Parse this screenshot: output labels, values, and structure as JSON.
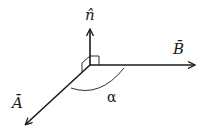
{
  "diagram": {
    "type": "vector-diagram",
    "labels": {
      "normal": "n̂",
      "vector_b": "B̄",
      "vector_a": "Ā",
      "angle": "α"
    },
    "elements": [
      {
        "name": "normal-vector",
        "label": "n̂",
        "direction": "up"
      },
      {
        "name": "vector-b",
        "label": "B̄",
        "direction": "right"
      },
      {
        "name": "vector-a",
        "label": "Ā",
        "direction": "down-left"
      },
      {
        "name": "angle-arc",
        "label": "α",
        "between": [
          "vector-a",
          "vector-b"
        ]
      },
      {
        "name": "right-angle-markers",
        "between": [
          "normal-vector",
          "vector-b"
        ]
      }
    ],
    "colors": {
      "stroke": "#1a1a1a",
      "background": "#ffffff"
    }
  }
}
